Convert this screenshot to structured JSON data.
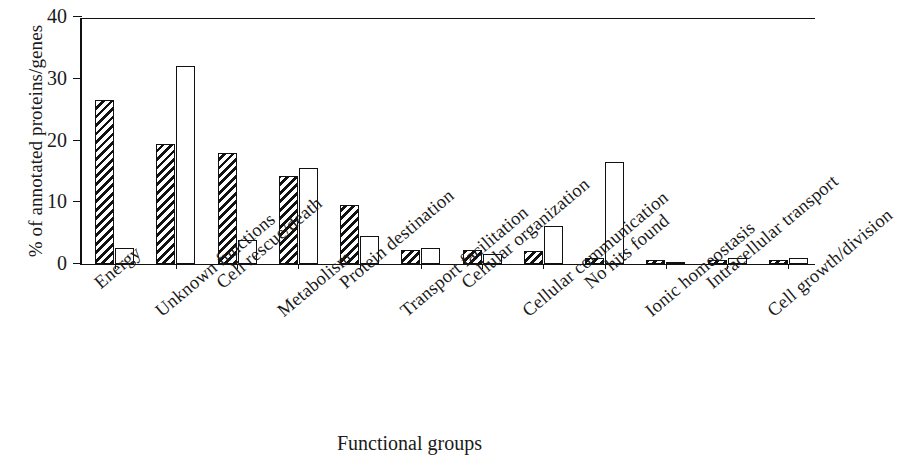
{
  "chart_data": {
    "type": "bar",
    "title": "",
    "xlabel": "Functional groups",
    "ylabel": "% of annotated proteins/genes",
    "ylim": [
      0,
      40
    ],
    "yticks": [
      0,
      10,
      20,
      30,
      40
    ],
    "grid": false,
    "legend": null,
    "categories": [
      "Energy",
      "Unknown functions",
      "Cell rescue/death",
      "Metabolism",
      "Protein destination",
      "Transport facilitation",
      "Cellular organization",
      "Cellular communication",
      "No hits found",
      "Ionic homeostasis",
      "Intracellular transport",
      "Cell growth/division"
    ],
    "series": [
      {
        "name": "hatched",
        "fill": "diagonal-hatch",
        "values": [
          26.5,
          19.4,
          18.0,
          14.2,
          9.6,
          2.2,
          2.2,
          2.1,
          0.9,
          0.7,
          0.7,
          0.7
        ]
      },
      {
        "name": "open",
        "fill": "white",
        "values": [
          2.6,
          32.0,
          3.9,
          15.5,
          4.5,
          2.6,
          1.7,
          6.1,
          16.5,
          0.4,
          0.9,
          1.0
        ]
      }
    ]
  },
  "style": {
    "axis_color": "#111111",
    "bar_edge_color": "#111111",
    "background": "#ffffff"
  }
}
